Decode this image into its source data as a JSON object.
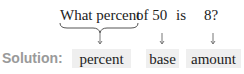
{
  "question": {
    "part1": "What percent",
    "part2": "of 50",
    "part3": "is",
    "part4": "8?"
  },
  "solution": {
    "label": "Solution:",
    "boxes": [
      {
        "label": "percent"
      },
      {
        "label": "base"
      },
      {
        "label": "amount"
      }
    ]
  },
  "colors": {
    "label_gray": "#9a9a9a",
    "box_bg": "#efefef"
  }
}
